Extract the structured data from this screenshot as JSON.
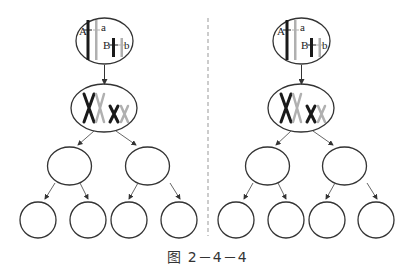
{
  "caption": "图 2－4－4",
  "panels": [
    {
      "id": "left",
      "parent_cell": {
        "labels": {
          "A": "A",
          "a": "a",
          "B": "B",
          "b": "b"
        }
      },
      "replicated_cell": {
        "chromosomes": [
          "X",
          "X",
          "x",
          "x"
        ]
      },
      "daughter_cells": 2,
      "granddaughter_cells": 4
    },
    {
      "id": "right",
      "parent_cell": {
        "labels": {
          "A": "A",
          "a": "a",
          "B": "B",
          "b": "b"
        }
      },
      "replicated_cell": {
        "chromosomes": [
          "X",
          "X",
          "x",
          "x"
        ]
      },
      "daughter_cells": 2,
      "granddaughter_cells": 4
    }
  ],
  "colors": {
    "dark": "#1a1a1a",
    "light": "#b0b0b0",
    "stroke": "#333333",
    "divider": "#999999"
  }
}
